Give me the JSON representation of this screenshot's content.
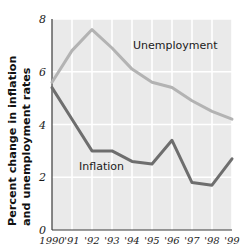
{
  "chart_data": {
    "type": "line",
    "title": "",
    "subtitle": "",
    "xlabel": "",
    "ylabel": "Percent change in inflation and unemployment rates",
    "x": [
      1990,
      1991,
      1992,
      1993,
      1994,
      1995,
      1996,
      1997,
      1998,
      1999
    ],
    "categories": [
      "1990",
      "'91",
      "'92",
      "'93",
      "'94",
      "'95",
      "'96",
      "'97",
      "'98",
      "'99"
    ],
    "xtick_labels": [
      "1990",
      "'91",
      "'92",
      "'93",
      "'94",
      "'95",
      "'96",
      "'97",
      "'98",
      "'99"
    ],
    "ytick_labels": [
      "0",
      "2",
      "4",
      "6",
      "8"
    ],
    "ytick_values": [
      0,
      2,
      4,
      6,
      8
    ],
    "ylim": [
      0,
      8
    ],
    "xlim": [
      1990,
      1999
    ],
    "grid": true,
    "grid_color": "#ffffff",
    "plot_background": "#eaeaea",
    "legend_position": "inline-annotations",
    "series": [
      {
        "name": "Unemployment",
        "color": "#b3b3b3",
        "label_x": 1994.05,
        "label_y": 6.85,
        "values": [
          5.6,
          6.8,
          7.6,
          6.9,
          6.1,
          5.6,
          5.4,
          4.9,
          4.5,
          4.2
        ]
      },
      {
        "name": "Inflation",
        "color": "#6e6e6e",
        "label_x": 1991.35,
        "label_y": 2.28,
        "values": [
          5.4,
          4.2,
          3.0,
          3.0,
          2.6,
          2.5,
          3.4,
          1.8,
          1.7,
          2.7
        ]
      }
    ],
    "annotations": [
      {
        "text": "Unemployment",
        "x": 1994.05,
        "y": 6.85
      },
      {
        "text": "Inflation",
        "x": 1991.35,
        "y": 2.28
      }
    ]
  }
}
